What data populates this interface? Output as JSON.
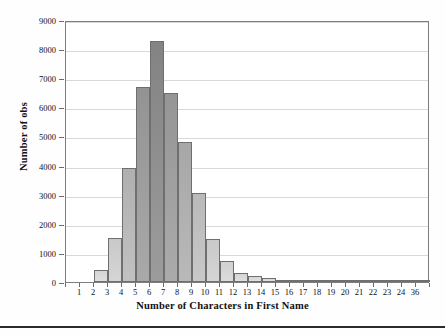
{
  "chart_data": {
    "type": "bar",
    "title": "",
    "xlabel": "Number of Characters in First Name",
    "ylabel": "Number of obs",
    "categories": [
      "1",
      "2",
      "3",
      "4",
      "5",
      "6",
      "7",
      "8",
      "9",
      "10",
      "11",
      "12",
      "13",
      "14",
      "15",
      "16",
      "17",
      "18",
      "19",
      "20",
      "21",
      "22",
      "23",
      "24",
      "36"
    ],
    "values": [
      0,
      400,
      1500,
      3900,
      6700,
      8280,
      6500,
      4800,
      3050,
      1480,
      710,
      320,
      200,
      130,
      70,
      50,
      35,
      20,
      12,
      22,
      8,
      5,
      4,
      3,
      3
    ],
    "ylim": [
      0,
      9000
    ],
    "yticks": [
      0,
      1000,
      2000,
      3000,
      4000,
      5000,
      6000,
      7000,
      8000,
      9000
    ],
    "ytick_labels": [
      "0",
      "1000",
      "2000",
      "3000",
      "4000",
      "5000",
      "6000",
      "7000",
      "8000",
      "9000"
    ],
    "grid": true,
    "legend": "none",
    "bar_fill_light": "#d8d8d8",
    "bar_fill_dark": "#7f7f7f",
    "bar_border": "#6f6f6f",
    "grid_color": "#d9d9d9",
    "axis_color": "#7d7d7d"
  }
}
